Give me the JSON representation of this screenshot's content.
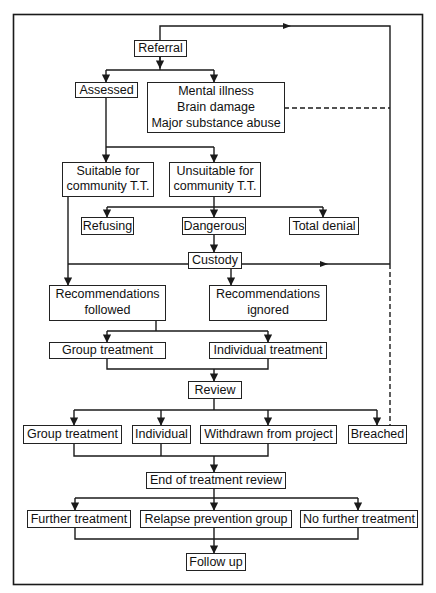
{
  "diagram": {
    "type": "flowchart",
    "nodes": {
      "referral": {
        "lines": [
          "Referral"
        ]
      },
      "assessed": {
        "lines": [
          "Assessed"
        ]
      },
      "excluded": {
        "lines": [
          "Mental illness",
          "Brain damage",
          "Major substance abuse"
        ]
      },
      "suitable": {
        "lines": [
          "Suitable for",
          "community T.T."
        ]
      },
      "unsuitable": {
        "lines": [
          "Unsuitable for",
          "community T.T."
        ]
      },
      "refusing": {
        "lines": [
          "Refusing"
        ]
      },
      "dangerous": {
        "lines": [
          "Dangerous"
        ]
      },
      "total_denial": {
        "lines": [
          "Total denial"
        ]
      },
      "custody": {
        "lines": [
          "Custody"
        ]
      },
      "rec_followed": {
        "lines": [
          "Recommendations",
          "followed"
        ]
      },
      "rec_ignored": {
        "lines": [
          "Recommendations",
          "ignored"
        ]
      },
      "group_treatment_1": {
        "lines": [
          "Group treatment"
        ]
      },
      "individual_treatment": {
        "lines": [
          "Individual treatment"
        ]
      },
      "review": {
        "lines": [
          "Review"
        ]
      },
      "group_treatment_2": {
        "lines": [
          "Group treatment"
        ]
      },
      "individual": {
        "lines": [
          "Individual"
        ]
      },
      "withdrawn": {
        "lines": [
          "Withdrawn from project"
        ]
      },
      "breached": {
        "lines": [
          "Breached"
        ]
      },
      "end_review": {
        "lines": [
          "End of treatment review"
        ]
      },
      "further_treatment": {
        "lines": [
          "Further treatment"
        ]
      },
      "relapse_group": {
        "lines": [
          "Relapse prevention group"
        ]
      },
      "no_further": {
        "lines": [
          "No further treatment"
        ]
      },
      "follow_up": {
        "lines": [
          "Follow up"
        ]
      }
    },
    "edges": [
      {
        "from": "referral",
        "to": "assessed",
        "style": "solid"
      },
      {
        "from": "referral",
        "to": "excluded",
        "style": "solid"
      },
      {
        "from": "excluded",
        "to": "referral",
        "style": "dashed",
        "note": "loop back via right side"
      },
      {
        "from": "assessed",
        "to": "suitable",
        "style": "solid"
      },
      {
        "from": "assessed",
        "to": "unsuitable",
        "style": "solid"
      },
      {
        "from": "unsuitable",
        "to": "refusing",
        "style": "solid"
      },
      {
        "from": "unsuitable",
        "to": "dangerous",
        "style": "solid"
      },
      {
        "from": "unsuitable",
        "to": "total_denial",
        "style": "solid"
      },
      {
        "from": "dangerous",
        "to": "custody",
        "style": "solid"
      },
      {
        "from": "custody",
        "to": "referral",
        "style": "solid",
        "note": "loop back via right side"
      },
      {
        "from": "suitable",
        "to": "rec_followed",
        "style": "solid"
      },
      {
        "from": "custody",
        "to": "rec_ignored",
        "style": "solid"
      },
      {
        "from": "rec_followed",
        "to": "group_treatment_1",
        "style": "solid"
      },
      {
        "from": "rec_followed",
        "to": "individual_treatment",
        "style": "solid"
      },
      {
        "from": "group_treatment_1",
        "to": "review",
        "style": "solid"
      },
      {
        "from": "individual_treatment",
        "to": "review",
        "style": "solid"
      },
      {
        "from": "review",
        "to": "group_treatment_2",
        "style": "solid"
      },
      {
        "from": "review",
        "to": "individual",
        "style": "solid"
      },
      {
        "from": "review",
        "to": "withdrawn",
        "style": "solid"
      },
      {
        "from": "review",
        "to": "breached",
        "style": "solid"
      },
      {
        "from": "breached",
        "to": "referral",
        "style": "dashed",
        "note": "loop back via right side"
      },
      {
        "from": "group_treatment_2",
        "to": "end_review",
        "style": "solid"
      },
      {
        "from": "individual",
        "to": "end_review",
        "style": "solid"
      },
      {
        "from": "withdrawn",
        "to": "end_review",
        "style": "solid"
      },
      {
        "from": "end_review",
        "to": "further_treatment",
        "style": "solid"
      },
      {
        "from": "end_review",
        "to": "relapse_group",
        "style": "solid"
      },
      {
        "from": "end_review",
        "to": "no_further",
        "style": "solid"
      },
      {
        "from": "further_treatment",
        "to": "follow_up",
        "style": "solid"
      },
      {
        "from": "relapse_group",
        "to": "follow_up",
        "style": "solid"
      },
      {
        "from": "no_further",
        "to": "follow_up",
        "style": "solid"
      }
    ]
  }
}
